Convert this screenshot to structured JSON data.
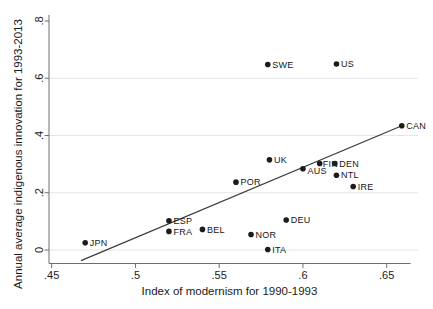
{
  "chart_data": {
    "type": "scatter",
    "title": "",
    "xlabel": "Index of modernism for 1990-1993",
    "ylabel": "Annual average indigenous innovation for 1993-2013",
    "xlim": [
      0.443,
      0.668
    ],
    "ylim": [
      -0.045,
      0.82
    ],
    "x_ticks": [
      ".45",
      ".5",
      ".55",
      ".6",
      ".65"
    ],
    "x_tick_values": [
      0.45,
      0.5,
      0.55,
      0.6,
      0.65
    ],
    "y_ticks": [
      "0",
      ".2",
      ".4",
      ".6",
      ".8"
    ],
    "y_tick_values": [
      0,
      0.2,
      0.4,
      0.6,
      0.8
    ],
    "y_gridline_values": [
      0,
      0.2,
      0.4,
      0.6
    ],
    "legend": "none",
    "grid": "horizontal",
    "points": [
      {
        "label": "JPN",
        "x": 0.47,
        "y": 0.025
      },
      {
        "label": "ESP",
        "x": 0.52,
        "y": 0.102
      },
      {
        "label": "FRA",
        "x": 0.52,
        "y": 0.065
      },
      {
        "label": "BEL",
        "x": 0.54,
        "y": 0.072
      },
      {
        "label": "NOR",
        "x": 0.569,
        "y": 0.054
      },
      {
        "label": "ITA",
        "x": 0.579,
        "y": 0.002
      },
      {
        "label": "DEU",
        "x": 0.59,
        "y": 0.105
      },
      {
        "label": "POR",
        "x": 0.56,
        "y": 0.237
      },
      {
        "label": "UK",
        "x": 0.58,
        "y": 0.315
      },
      {
        "label": "AUS",
        "x": 0.6,
        "y": 0.284,
        "label_dy": 2.5
      },
      {
        "label": "FIN",
        "x": 0.61,
        "y": 0.302,
        "label_dx": 3
      },
      {
        "label": "DEN",
        "x": 0.619,
        "y": 0.302
      },
      {
        "label": "NTL",
        "x": 0.62,
        "y": 0.261
      },
      {
        "label": "IRE",
        "x": 0.63,
        "y": 0.222
      },
      {
        "label": "SWE",
        "x": 0.579,
        "y": 0.648
      },
      {
        "label": "US",
        "x": 0.62,
        "y": 0.65
      },
      {
        "label": "CAN",
        "x": 0.659,
        "y": 0.434
      }
    ],
    "trend_line": {
      "x1": 0.4675,
      "y1": -0.037,
      "x2": 0.658,
      "y2": 0.4315
    },
    "colors": {
      "marker": "#1c1c1c",
      "trend_line": "#3c3c3c",
      "grid": "#e2e7e7",
      "axis": "#6e6e6e",
      "text": "#1a1a1a"
    }
  }
}
